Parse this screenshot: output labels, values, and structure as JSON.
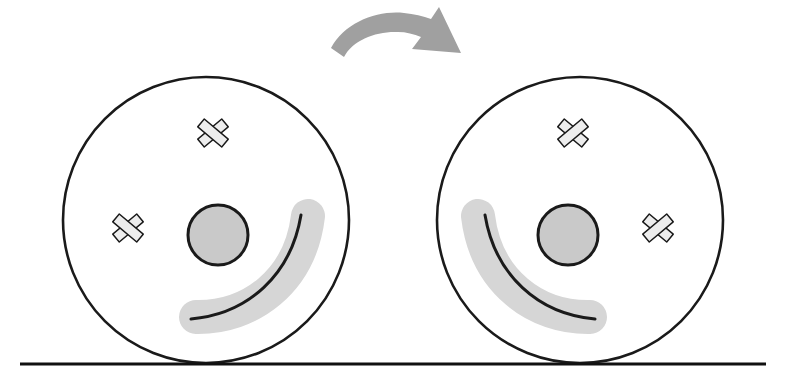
{
  "figure": {
    "type": "diagram",
    "title": "",
    "canvas": {
      "width": 796,
      "height": 389,
      "background": "#ffffff"
    }
  },
  "colors": {
    "outline": "#1a1a1a",
    "face_fill": "#ffffff",
    "nose_fill": "#c9c9c9",
    "cross_fill": "#ededed",
    "highlight": "#d6d6d6",
    "arrow_fill": "#a0a0a0",
    "ground": "#111111"
  },
  "ground_line": {
    "label": "ground-line",
    "x1": 20,
    "y1": 364,
    "x2": 766,
    "y2": 364,
    "thickness": 3
  },
  "arrow": {
    "label": "flip-arrow",
    "direction": "left-to-right",
    "start": [
      332,
      46
    ],
    "end": [
      460,
      52
    ],
    "apex": [
      392,
      18
    ],
    "fill": "#a0a0a0"
  },
  "faces": [
    {
      "name": "left-face",
      "label": "Original orientation",
      "center": [
        206,
        220
      ],
      "radius": 143,
      "mirrored": false,
      "nose": {
        "center": [
          218,
          235
        ],
        "radius": 30,
        "fill": "#c9c9c9"
      },
      "crosses": [
        {
          "name": "upper-cross",
          "center": [
            213,
            133
          ],
          "size": 31,
          "rotation": 0
        },
        {
          "name": "side-cross",
          "center": [
            128,
            228
          ],
          "size": 31,
          "rotation": 0
        }
      ],
      "smile": {
        "name": "smile-curve",
        "start": [
          193,
          319
        ],
        "end": [
          310,
          218
        ],
        "highlighted": true
      }
    },
    {
      "name": "right-face",
      "label": "Flipped orientation",
      "center": [
        580,
        220
      ],
      "radius": 143,
      "mirrored": true,
      "nose": {
        "center": [
          568,
          235
        ],
        "radius": 30,
        "fill": "#c9c9c9"
      },
      "crosses": [
        {
          "name": "upper-cross",
          "center": [
            573,
            133
          ],
          "size": 31,
          "rotation": 0
        },
        {
          "name": "side-cross",
          "center": [
            658,
            228
          ],
          "size": 31,
          "rotation": 0
        }
      ],
      "smile": {
        "name": "smile-curve",
        "start": [
          593,
          319
        ],
        "end": [
          476,
          218
        ],
        "highlighted": true
      }
    }
  ]
}
